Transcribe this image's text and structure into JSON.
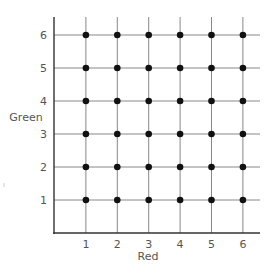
{
  "chart_data": {
    "type": "scatter",
    "title": "",
    "xlabel": "Red",
    "ylabel": "Green",
    "x_ticks": [
      1,
      2,
      3,
      4,
      5,
      6
    ],
    "y_ticks": [
      1,
      2,
      3,
      4,
      5,
      6
    ],
    "xlim": [
      0,
      6.5
    ],
    "ylim": [
      0,
      6.5
    ],
    "grid": true,
    "legend": null,
    "points": [
      {
        "x": 1,
        "y": 1
      },
      {
        "x": 2,
        "y": 1
      },
      {
        "x": 3,
        "y": 1
      },
      {
        "x": 4,
        "y": 1
      },
      {
        "x": 5,
        "y": 1
      },
      {
        "x": 6,
        "y": 1
      },
      {
        "x": 1,
        "y": 2
      },
      {
        "x": 2,
        "y": 2
      },
      {
        "x": 3,
        "y": 2
      },
      {
        "x": 4,
        "y": 2
      },
      {
        "x": 5,
        "y": 2
      },
      {
        "x": 6,
        "y": 2
      },
      {
        "x": 1,
        "y": 3
      },
      {
        "x": 2,
        "y": 3
      },
      {
        "x": 3,
        "y": 3
      },
      {
        "x": 4,
        "y": 3
      },
      {
        "x": 5,
        "y": 3
      },
      {
        "x": 6,
        "y": 3
      },
      {
        "x": 1,
        "y": 4
      },
      {
        "x": 2,
        "y": 4
      },
      {
        "x": 3,
        "y": 4
      },
      {
        "x": 4,
        "y": 4
      },
      {
        "x": 5,
        "y": 4
      },
      {
        "x": 6,
        "y": 4
      },
      {
        "x": 1,
        "y": 5
      },
      {
        "x": 2,
        "y": 5
      },
      {
        "x": 3,
        "y": 5
      },
      {
        "x": 4,
        "y": 5
      },
      {
        "x": 5,
        "y": 5
      },
      {
        "x": 6,
        "y": 5
      },
      {
        "x": 1,
        "y": 6
      },
      {
        "x": 2,
        "y": 6
      },
      {
        "x": 3,
        "y": 6
      },
      {
        "x": 4,
        "y": 6
      },
      {
        "x": 5,
        "y": 6
      },
      {
        "x": 6,
        "y": 6
      }
    ],
    "colors": {
      "axis": "#333333",
      "grid": "#888888",
      "point": "#111111",
      "text": "#555555"
    }
  }
}
